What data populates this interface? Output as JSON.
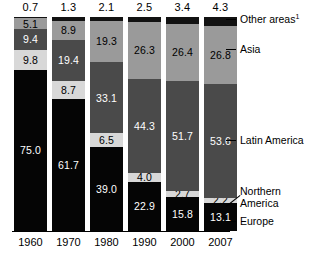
{
  "chart_data": {
    "type": "bar",
    "title": "",
    "xlabel": "",
    "ylabel": "",
    "stacked": true,
    "normalized": true,
    "ylim": [
      0,
      100
    ],
    "grid": false,
    "legend_position": "right",
    "categories": [
      "1960",
      "1970",
      "1980",
      "1990",
      "2000",
      "2007"
    ],
    "totals_label": [
      "0.7",
      "1.3",
      "2.1",
      "2.5",
      "3.4",
      "4.3"
    ],
    "totals": [
      0.7,
      1.3,
      2.1,
      2.5,
      3.4,
      4.3
    ],
    "series": [
      {
        "name": "Other areas",
        "name_display": "Other areas",
        "footnote": "1",
        "color": "#121212",
        "values": [
          0.7,
          1.7,
          1.8,
          2.5,
          3.4,
          4.3
        ],
        "labels": [
          "",
          "",
          "",
          "",
          "",
          ""
        ]
      },
      {
        "name": "Asia",
        "color": "#9a9a9a",
        "values": [
          5.1,
          8.9,
          19.3,
          26.3,
          26.4,
          26.8
        ],
        "labels": [
          "5.1",
          "8.9",
          "19.3",
          "26.3",
          "26.4",
          "26.8"
        ]
      },
      {
        "name": "Latin America",
        "color": "#4a4a4a",
        "values": [
          9.4,
          19.4,
          33.1,
          44.3,
          51.7,
          53.6
        ],
        "labels": [
          "9.4",
          "19.4",
          "33.1",
          "44.3",
          "51.7",
          "53.6"
        ]
      },
      {
        "name": "Northern America",
        "color": "#d8d8d8",
        "values": [
          9.8,
          8.7,
          6.5,
          4.0,
          2.7,
          2.2
        ],
        "labels": [
          "9.8",
          "8.7",
          "6.5",
          "4.0",
          "2.7",
          "2.2"
        ]
      },
      {
        "name": "Europe",
        "color": "#050505",
        "values": [
          75.0,
          61.7,
          39.0,
          22.9,
          15.8,
          13.1
        ],
        "labels": [
          "75.0",
          "61.7",
          "39.0",
          "22.9",
          "15.8",
          "13.1"
        ]
      }
    ]
  },
  "legend": {
    "items": [
      {
        "label": "Other areas",
        "footnote": "1"
      },
      {
        "label": "Asia",
        "footnote": ""
      },
      {
        "label": "Latin America",
        "footnote": ""
      },
      {
        "label": "Northern America",
        "footnote": ""
      },
      {
        "label": "Europe",
        "footnote": ""
      }
    ]
  }
}
